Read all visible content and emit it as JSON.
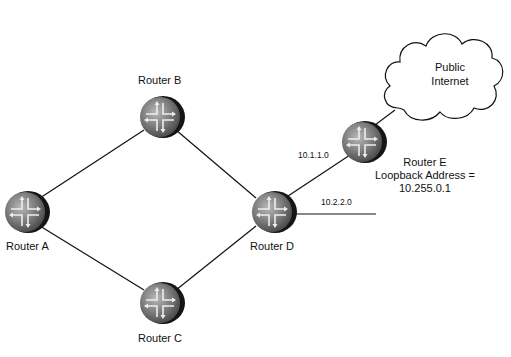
{
  "diagram": {
    "routers": [
      {
        "id": "A",
        "label": "Router A",
        "x": 25,
        "y": 212
      },
      {
        "id": "B",
        "label": "Router B",
        "x": 160,
        "y": 117
      },
      {
        "id": "C",
        "label": "Router C",
        "x": 160,
        "y": 303
      },
      {
        "id": "D",
        "label": "Router D",
        "x": 272,
        "y": 212
      },
      {
        "id": "E",
        "label": "Router E",
        "x": 362,
        "y": 142
      }
    ],
    "router_e_details": {
      "loopback_line": "Loopback  Address =",
      "loopback_value": "10.255.0.1"
    },
    "cloud": {
      "line1": "Public",
      "line2": "Internet"
    },
    "links": [
      {
        "from": "A",
        "to": "B"
      },
      {
        "from": "A",
        "to": "C"
      },
      {
        "from": "B",
        "to": "D"
      },
      {
        "from": "C",
        "to": "D"
      },
      {
        "from": "D",
        "to": "E",
        "label": "10.1.1.0"
      },
      {
        "from": "D",
        "to": "stub",
        "label": "10.2.2.0"
      },
      {
        "from": "E",
        "to": "cloud"
      }
    ],
    "link_labels": {
      "d_e": "10.1.1.0",
      "d_stub": "10.2.2.0"
    }
  }
}
